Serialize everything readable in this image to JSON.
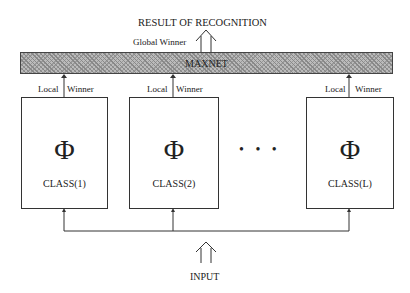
{
  "title": "RESULT OF RECOGNITION",
  "global_winner": "Global Winner",
  "maxnet": "MAXNET",
  "local_label": "Local",
  "winner_label": "Winner",
  "classes": [
    {
      "symbol": "Φ",
      "label": "CLASS(1)"
    },
    {
      "symbol": "Φ",
      "label": "CLASS(2)"
    },
    {
      "symbol": "Φ",
      "label": "CLASS(L)"
    }
  ],
  "ellipsis": "• • •",
  "input": "INPUT"
}
